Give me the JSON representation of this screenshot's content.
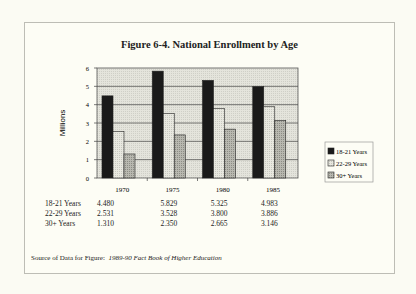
{
  "chart_data": {
    "type": "bar",
    "title": "Figure 6-4. National Enrollment by Age",
    "xlabel": "",
    "ylabel": "Millions",
    "ylim": [
      0,
      6
    ],
    "yticks": [
      "0",
      "1",
      "2",
      "3",
      "4",
      "5",
      "6"
    ],
    "grid": true,
    "legend_position": "right",
    "categories": [
      "1970",
      "1975",
      "1980",
      "1985"
    ],
    "series": [
      {
        "name": "18-21 Years",
        "values": [
          4.48,
          5.829,
          5.325,
          4.983
        ],
        "labels": [
          "4.480",
          "5.829",
          "5.325",
          "4.983"
        ],
        "color": "#1a1a1a"
      },
      {
        "name": "22-29 Years",
        "values": [
          2.531,
          3.528,
          3.8,
          3.886
        ],
        "labels": [
          "2.531",
          "3.528",
          "3.800",
          "3.886"
        ],
        "color": "#dcdcd4"
      },
      {
        "name": "30+ Years",
        "values": [
          1.31,
          2.35,
          2.665,
          3.146
        ],
        "labels": [
          "1.310",
          "2.350",
          "2.665",
          "3.146"
        ],
        "color": "#a8a8a0"
      }
    ]
  },
  "source": {
    "label": "Source of Data for Figure:",
    "title": "1989-90 Fact Book of Higher Education"
  }
}
